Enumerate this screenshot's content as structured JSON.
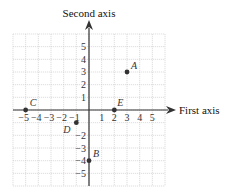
{
  "diagram": {
    "x_axis_label": "First axis",
    "y_axis_label": "Second axis",
    "x_tick_labels": [
      "−5",
      "−4",
      "−3",
      "−2",
      "−1",
      "1",
      "2",
      "3",
      "4",
      "5"
    ],
    "y_tick_labels": [
      "5",
      "4",
      "3",
      "2",
      "1",
      "−2",
      "−3",
      "−4",
      "−5"
    ],
    "grid_range": {
      "xmin": -6,
      "xmax": 6,
      "ymin": -6,
      "ymax": 6
    },
    "points": [
      {
        "label": "A",
        "x": 3,
        "y": 3
      },
      {
        "label": "B",
        "x": 0,
        "y": -4
      },
      {
        "label": "C",
        "x": -5,
        "y": 0
      },
      {
        "label": "D",
        "x": -1,
        "y": -1
      },
      {
        "label": "E",
        "x": 2,
        "y": 0
      }
    ],
    "colors": {
      "grid": "#c8c8c8",
      "axis": "#333333",
      "point": "#333333"
    }
  }
}
